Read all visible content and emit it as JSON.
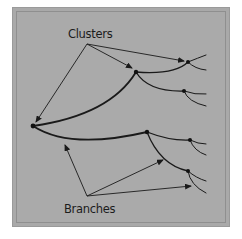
{
  "diagram": {
    "labels": {
      "clusters": "Clusters",
      "branches": "Branches"
    },
    "colors": {
      "background": "#aaaaaa",
      "line": "#1a1a1a"
    },
    "nodes": [
      {
        "id": "root",
        "x": 33,
        "y": 126
      },
      {
        "id": "upper-branch",
        "x": 136,
        "y": 72
      },
      {
        "id": "upper-cluster-a",
        "x": 188,
        "y": 62
      },
      {
        "id": "upper-cluster-b",
        "x": 184,
        "y": 91
      },
      {
        "id": "lower-branch",
        "x": 147,
        "y": 132
      },
      {
        "id": "lower-cluster-a",
        "x": 190,
        "y": 140
      },
      {
        "id": "lower-cluster-b",
        "x": 188,
        "y": 171
      }
    ]
  }
}
